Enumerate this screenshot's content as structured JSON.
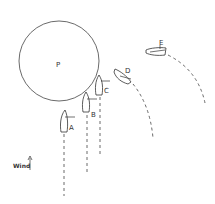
{
  "diagram": {
    "mark_label": "P",
    "wind_label": "Wind",
    "boats": [
      {
        "id": "A",
        "label": "A"
      },
      {
        "id": "B",
        "label": "B"
      },
      {
        "id": "C",
        "label": "C"
      },
      {
        "id": "D",
        "label": "D"
      },
      {
        "id": "E",
        "label": "E"
      }
    ],
    "colors": {
      "line": "#333333",
      "background": "#ffffff"
    }
  }
}
